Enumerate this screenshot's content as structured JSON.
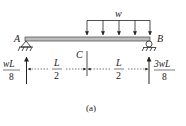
{
  "diagram": {
    "caption": "(a)",
    "load_label": "w",
    "points": {
      "A": "A",
      "B": "B",
      "C": "C"
    },
    "dimensions": [
      {
        "num": "L",
        "den": "2"
      },
      {
        "num": "L",
        "den": "2"
      }
    ],
    "reactions": {
      "left": {
        "num": "wL",
        "den": "8"
      },
      "right": {
        "num": "3wL",
        "den": "8"
      }
    },
    "colors": {
      "line": "#222222",
      "beam_fill": "#bdbdbd",
      "background": "#ffffff"
    }
  }
}
